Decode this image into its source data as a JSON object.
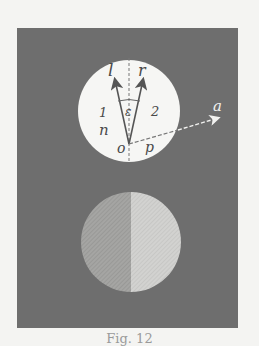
{
  "figure": {
    "panel_color": "#6e6e6e",
    "background": "#f4f4f2",
    "top_circle": {
      "fill": "#f6f6f4",
      "labels": {
        "l": "l",
        "r": "r",
        "epsilon": "ε",
        "one": "1",
        "two": "2",
        "n": "n",
        "o": "o",
        "p": "p",
        "a": "a"
      }
    },
    "bottom_circle": {
      "left_half_color": "#a3a3a3",
      "right_half_color": "#cfcfcd"
    },
    "caption": "Fig. 12"
  }
}
